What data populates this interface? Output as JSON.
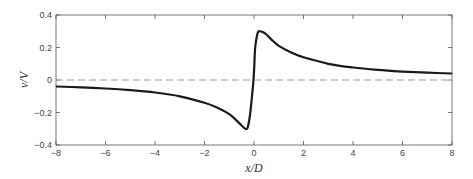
{
  "chart_data": {
    "type": "line",
    "title": "",
    "xlabel": "x/D",
    "ylabel": "v/V",
    "xlim": [
      -8,
      8
    ],
    "ylim": [
      -0.4,
      0.4
    ],
    "xticks": [
      -8,
      -6,
      -4,
      -2,
      0,
      2,
      4,
      6,
      8
    ],
    "yticks": [
      -0.4,
      -0.2,
      0,
      0.2,
      0.4
    ],
    "xtick_labels": [
      "−8",
      "−6",
      "−4",
      "−2",
      "0",
      "2",
      "4",
      "6",
      "8"
    ],
    "ytick_labels": [
      "−0.4",
      "−0.2",
      "0",
      "0.2",
      "0.4"
    ],
    "grid": false,
    "legend": null,
    "series": [
      {
        "name": "v/V",
        "style": "solid",
        "color": "#1a1a1a",
        "x": [
          -8,
          -7,
          -6,
          -5,
          -4,
          -3,
          -2,
          -1.5,
          -1,
          -0.7,
          -0.5,
          -0.35,
          -0.25,
          -0.15,
          -0.05,
          0,
          0.05,
          0.15,
          0.25,
          0.35,
          0.5,
          0.7,
          1,
          1.5,
          2,
          3,
          4,
          5,
          6,
          7,
          8
        ],
        "y": [
          -0.04,
          -0.045,
          -0.052,
          -0.062,
          -0.077,
          -0.1,
          -0.14,
          -0.17,
          -0.21,
          -0.25,
          -0.28,
          -0.3,
          -0.29,
          -0.2,
          -0.05,
          0.05,
          0.2,
          0.29,
          0.3,
          0.295,
          0.28,
          0.25,
          0.21,
          0.17,
          0.14,
          0.1,
          0.077,
          0.062,
          0.052,
          0.045,
          0.04
        ]
      },
      {
        "name": "zero reference",
        "style": "dashed",
        "color": "#999999",
        "x": [
          -8,
          8
        ],
        "y": [
          0,
          0
        ]
      }
    ]
  }
}
